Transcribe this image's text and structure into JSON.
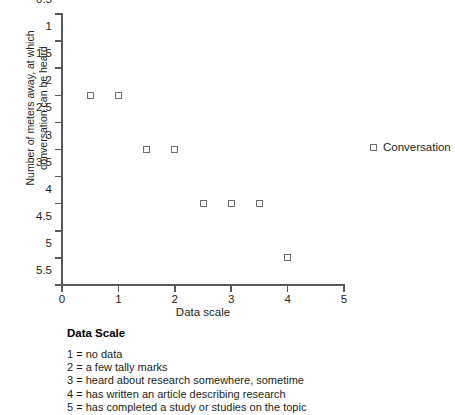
{
  "chart_data": {
    "type": "scatter",
    "title": "",
    "xlabel": "Data scale",
    "ylabel": "Number of meters away, at which conversation can be heard",
    "xlim": [
      0,
      5
    ],
    "ylim": [
      0.5,
      5.5
    ],
    "y_axis_inverted": true,
    "grid": false,
    "xticks": [
      "0",
      "1",
      "2",
      "3",
      "4",
      "5"
    ],
    "xtick_values": [
      0,
      1,
      2,
      3,
      4,
      5
    ],
    "yticks": [
      "0.5",
      "1",
      "1.5",
      "2",
      "2.5",
      "3",
      "3.5",
      "4",
      "4.5",
      "5",
      "5.5"
    ],
    "ytick_values": [
      0.5,
      1,
      1.5,
      2,
      2.5,
      3,
      3.5,
      4,
      4.5,
      5,
      5.5
    ],
    "legend_position": "right",
    "series": [
      {
        "name": "Conversation",
        "marker": "open-square",
        "color": "#6d6e71",
        "points": [
          {
            "x": 0.5,
            "y": 2
          },
          {
            "x": 1.0,
            "y": 2
          },
          {
            "x": 1.5,
            "y": 3
          },
          {
            "x": 2.0,
            "y": 3
          },
          {
            "x": 2.5,
            "y": 4
          },
          {
            "x": 3.0,
            "y": 4
          },
          {
            "x": 3.5,
            "y": 4
          },
          {
            "x": 4.0,
            "y": 5
          }
        ]
      }
    ]
  },
  "legend": {
    "entries": [
      {
        "label": "Conversation"
      }
    ]
  },
  "scale_key": {
    "title": "Data Scale",
    "items": [
      "1 = no data",
      "2 = a few tally marks",
      "3 = heard about research somewhere, sometime",
      "4 = has written an article describing research",
      "5 = has completed a study or studies on the topic"
    ]
  }
}
